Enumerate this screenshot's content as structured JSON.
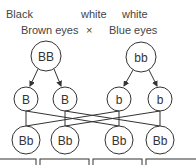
{
  "labels": {
    "left_color": "Black",
    "left_trait": "Brown eyes",
    "cross_symbol": "×",
    "right_color_1": "white",
    "right_color_2": "white",
    "right_trait": "Blue eyes"
  },
  "parents": [
    {
      "genotype": "BB"
    },
    {
      "genotype": "bb"
    }
  ],
  "gametes": [
    {
      "allele": "B"
    },
    {
      "allele": "B"
    },
    {
      "allele": "b"
    },
    {
      "allele": "b"
    }
  ],
  "offspring": [
    {
      "genotype": "Bb"
    },
    {
      "genotype": "Bb"
    },
    {
      "genotype": "Bb"
    },
    {
      "genotype": "Bb"
    }
  ],
  "colors": {
    "stroke": "#333333",
    "text": "#333333",
    "background": "#ffffff"
  }
}
